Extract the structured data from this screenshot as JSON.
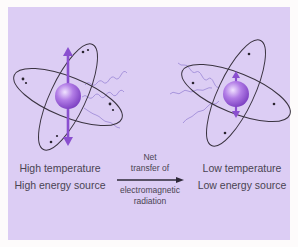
{
  "diagram": {
    "left": {
      "title": "High temperature",
      "subtitle": "High energy source",
      "vibration": "large"
    },
    "right": {
      "title": "Low temperature",
      "subtitle": "Low energy source",
      "vibration": "small"
    },
    "arrow": {
      "label_top_1": "Net",
      "label_top_2": "transfer of",
      "label_bottom_1": "electromagnetic",
      "label_bottom_2": "radiation",
      "direction": "left-to-right"
    },
    "colors": {
      "background": "#dccdf4",
      "nucleus": "#a06ad8",
      "vibration_arrow": "#8a4fcf",
      "orbit": "#3a3340",
      "wave": "#9b86d6",
      "text": "#4a4452"
    }
  }
}
